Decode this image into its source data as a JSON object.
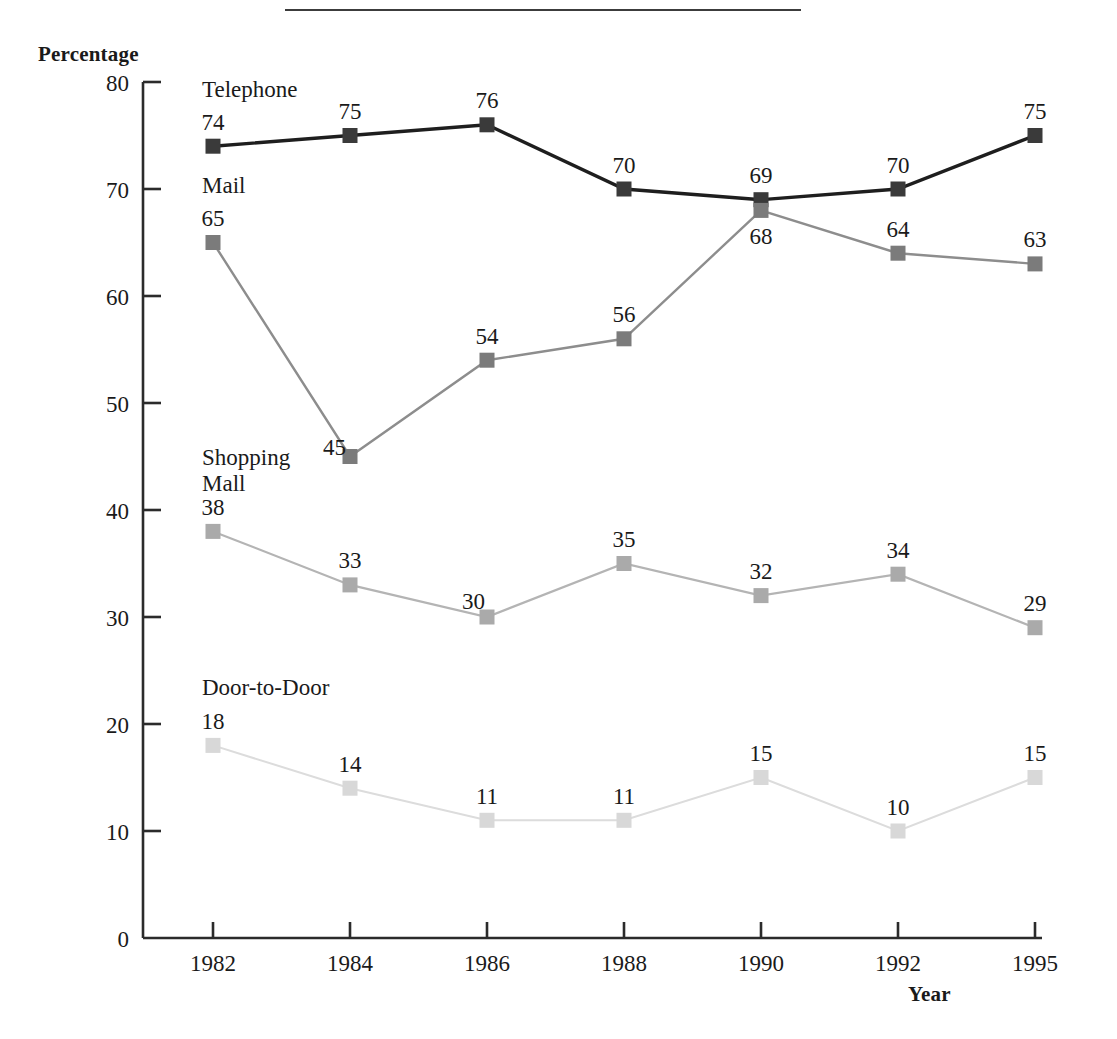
{
  "figure": {
    "y_axis_title": "Percentage",
    "x_axis_title": "Year",
    "rule_present": true
  },
  "chart_data": {
    "type": "line",
    "title": "",
    "xlabel": "Year",
    "ylabel": "Percentage",
    "categories": [
      "1982",
      "1984",
      "1986",
      "1988",
      "1990",
      "1992",
      "1995"
    ],
    "x": [
      1982,
      1984,
      1986,
      1988,
      1990,
      1992,
      1995
    ],
    "ylim": [
      0,
      80
    ],
    "yticks": [
      0,
      10,
      20,
      30,
      40,
      50,
      60,
      70,
      80
    ],
    "ytick_labels": [
      "0",
      "10",
      "20",
      "30",
      "40",
      "50",
      "60",
      "70",
      "80"
    ],
    "grid": false,
    "legend": "inline-series-labels",
    "marker": "square",
    "data_labels": true,
    "series": [
      {
        "name": "Telephone",
        "color": "#3a3a3a",
        "line_color": "#1e1e1e",
        "line_width": 3.4,
        "marker_size": 15,
        "values": [
          74,
          75,
          76,
          70,
          69,
          70,
          75
        ],
        "label_text": [
          "74",
          "75",
          "76",
          "70",
          "69",
          "70",
          "75"
        ],
        "label_position": [
          "above",
          "above",
          "above",
          "above",
          "above",
          "above",
          "above"
        ]
      },
      {
        "name": "Mail",
        "color": "#7b7b7b",
        "line_color": "#8d8d8d",
        "line_width": 2.4,
        "marker_size": 15,
        "values": [
          65,
          45,
          54,
          56,
          68,
          64,
          63
        ],
        "label_text": [
          "65",
          "45",
          "54",
          "56",
          "68",
          "64",
          "63"
        ],
        "label_position": [
          "above",
          "left",
          "above",
          "above",
          "below",
          "above",
          "above"
        ]
      },
      {
        "name": "Shopping Mall",
        "color": "#aaaaaa",
        "line_color": "#b4b4b4",
        "line_width": 2.2,
        "marker_size": 15,
        "values": [
          38,
          33,
          30,
          35,
          32,
          34,
          29
        ],
        "label_text": [
          "38",
          "33",
          "30",
          "35",
          "32",
          "34",
          "29"
        ],
        "label_position": [
          "above",
          "above",
          "above-left",
          "above",
          "above",
          "above",
          "above"
        ]
      },
      {
        "name": "Door-to-Door",
        "color": "#d8d8d8",
        "line_color": "#dcdcdc",
        "line_width": 2.0,
        "marker_size": 15,
        "values": [
          18,
          14,
          11,
          11,
          15,
          10,
          15
        ],
        "label_text": [
          "18",
          "14",
          "11",
          "11",
          "15",
          "10",
          "15"
        ],
        "label_position": [
          "above",
          "above",
          "above",
          "above",
          "above",
          "above",
          "above"
        ]
      }
    ],
    "series_annotations": [
      {
        "name": "Telephone",
        "lines": [
          "Telephone"
        ]
      },
      {
        "name": "Mail",
        "lines": [
          "Mail"
        ]
      },
      {
        "name": "Shopping Mall",
        "lines": [
          "Shopping",
          "Mall"
        ]
      },
      {
        "name": "Door-to-Door",
        "lines": [
          "Door-to-Door"
        ]
      }
    ]
  }
}
